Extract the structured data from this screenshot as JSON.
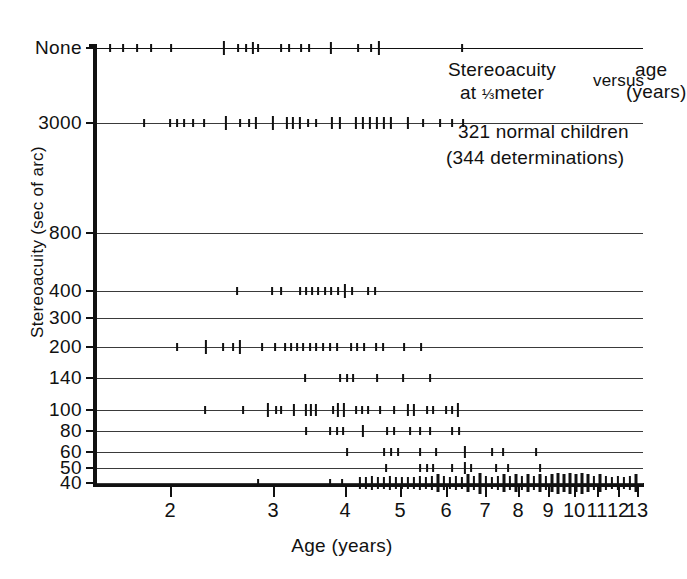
{
  "chart_data": {
    "type": "scatter",
    "subtitle": "321 normal children",
    "subtitle2": "(344 determinations)",
    "title_parts": {
      "stereoacuity": "Stereoacuity",
      "at_meter_pre": "at ",
      "fraction": "1/3",
      "at_meter_post": "meter",
      "versus": "versus",
      "age": "age",
      "years": "(years)"
    },
    "xlabel": "Age (years)",
    "ylabel": "Stereoacuity (sec of arc)",
    "xscale": "log",
    "xlim": [
      1.3,
      13.4
    ],
    "grid": true,
    "legend": "none",
    "n_children": 321,
    "n_determinations": 344,
    "xticks": [
      {
        "label": "2",
        "value": 2,
        "px": 170
      },
      {
        "label": "3",
        "value": 3,
        "px": 273
      },
      {
        "label": "4",
        "value": 4,
        "px": 345
      },
      {
        "label": "5",
        "value": 5,
        "px": 400
      },
      {
        "label": "6",
        "value": 6,
        "px": 446
      },
      {
        "label": "7",
        "value": 7,
        "px": 485
      },
      {
        "label": "8",
        "value": 8,
        "px": 518
      },
      {
        "label": "9",
        "value": 9,
        "px": 548
      },
      {
        "label": "10",
        "value": 10,
        "px": 574
      },
      {
        "label": "11",
        "value": 11,
        "px": 597
      },
      {
        "label": "12",
        "value": 12,
        "px": 618
      },
      {
        "label": "13",
        "value": 13,
        "px": 637
      }
    ],
    "yticks": [
      {
        "label": "None",
        "value": "None",
        "px": 48
      },
      {
        "label": "3000",
        "value": 3000,
        "px": 123
      },
      {
        "label": "800",
        "value": 800,
        "px": 233
      },
      {
        "label": "400",
        "value": 400,
        "px": 291
      },
      {
        "label": "300",
        "value": 300,
        "px": 318
      },
      {
        "label": "200",
        "value": 200,
        "px": 347
      },
      {
        "label": "140",
        "value": 140,
        "px": 378
      },
      {
        "label": "100",
        "value": 100,
        "px": 410
      },
      {
        "label": "80",
        "value": 80,
        "px": 431
      },
      {
        "label": "60",
        "value": 60,
        "px": 452
      },
      {
        "label": "50",
        "value": 50,
        "px": 468
      },
      {
        "label": "40",
        "value": 40,
        "px": 483
      }
    ],
    "series": [
      {
        "name": "None",
        "y_label": "None",
        "row_px": 48,
        "points": [
          {
            "x_px": 110,
            "count": 1
          },
          {
            "x_px": 123,
            "count": 1
          },
          {
            "x_px": 137,
            "count": 1
          },
          {
            "x_px": 151,
            "count": 1
          },
          {
            "x_px": 171,
            "count": 1
          },
          {
            "x_px": 224,
            "count": 3
          },
          {
            "x_px": 238,
            "count": 1
          },
          {
            "x_px": 246,
            "count": 1
          },
          {
            "x_px": 253,
            "count": 2
          },
          {
            "x_px": 258,
            "count": 1
          },
          {
            "x_px": 281,
            "count": 1
          },
          {
            "x_px": 289,
            "count": 1
          },
          {
            "x_px": 301,
            "count": 1
          },
          {
            "x_px": 309,
            "count": 1
          },
          {
            "x_px": 331,
            "count": 2
          },
          {
            "x_px": 358,
            "count": 1
          },
          {
            "x_px": 371,
            "count": 1
          },
          {
            "x_px": 379,
            "count": 3
          },
          {
            "x_px": 462,
            "count": 1
          }
        ]
      },
      {
        "name": "3000",
        "y_label": "3000",
        "row_px": 123,
        "points": [
          {
            "x_px": 144,
            "count": 1
          },
          {
            "x_px": 170,
            "count": 1
          },
          {
            "x_px": 177,
            "count": 1
          },
          {
            "x_px": 184,
            "count": 1
          },
          {
            "x_px": 193,
            "count": 1
          },
          {
            "x_px": 204,
            "count": 1
          },
          {
            "x_px": 226,
            "count": 3
          },
          {
            "x_px": 240,
            "count": 1
          },
          {
            "x_px": 249,
            "count": 1
          },
          {
            "x_px": 256,
            "count": 2
          },
          {
            "x_px": 273,
            "count": 3
          },
          {
            "x_px": 287,
            "count": 2
          },
          {
            "x_px": 293,
            "count": 2
          },
          {
            "x_px": 300,
            "count": 2
          },
          {
            "x_px": 308,
            "count": 1
          },
          {
            "x_px": 316,
            "count": 1
          },
          {
            "x_px": 332,
            "count": 2
          },
          {
            "x_px": 340,
            "count": 2
          },
          {
            "x_px": 356,
            "count": 2
          },
          {
            "x_px": 363,
            "count": 2
          },
          {
            "x_px": 370,
            "count": 2
          },
          {
            "x_px": 377,
            "count": 2
          },
          {
            "x_px": 384,
            "count": 2
          },
          {
            "x_px": 391,
            "count": 2
          },
          {
            "x_px": 408,
            "count": 2
          },
          {
            "x_px": 423,
            "count": 1
          },
          {
            "x_px": 440,
            "count": 1
          },
          {
            "x_px": 452,
            "count": 1
          },
          {
            "x_px": 463,
            "count": 1
          }
        ]
      },
      {
        "name": "800",
        "y_label": "800",
        "row_px": 233,
        "points": []
      },
      {
        "name": "400",
        "y_label": "400",
        "row_px": 291,
        "points": [
          {
            "x_px": 237,
            "count": 1
          },
          {
            "x_px": 272,
            "count": 1
          },
          {
            "x_px": 281,
            "count": 1
          },
          {
            "x_px": 300,
            "count": 1
          },
          {
            "x_px": 306,
            "count": 1
          },
          {
            "x_px": 312,
            "count": 1
          },
          {
            "x_px": 318,
            "count": 1
          },
          {
            "x_px": 325,
            "count": 1
          },
          {
            "x_px": 331,
            "count": 1
          },
          {
            "x_px": 338,
            "count": 1
          },
          {
            "x_px": 345,
            "count": 3
          },
          {
            "x_px": 352,
            "count": 1
          },
          {
            "x_px": 368,
            "count": 1
          },
          {
            "x_px": 375,
            "count": 1
          }
        ]
      },
      {
        "name": "300",
        "y_label": "300",
        "row_px": 318,
        "points": []
      },
      {
        "name": "200",
        "y_label": "200",
        "row_px": 347,
        "points": [
          {
            "x_px": 177,
            "count": 1
          },
          {
            "x_px": 206,
            "count": 3
          },
          {
            "x_px": 223,
            "count": 1
          },
          {
            "x_px": 233,
            "count": 1
          },
          {
            "x_px": 240,
            "count": 3
          },
          {
            "x_px": 262,
            "count": 1
          },
          {
            "x_px": 275,
            "count": 1
          },
          {
            "x_px": 285,
            "count": 1
          },
          {
            "x_px": 291,
            "count": 1
          },
          {
            "x_px": 297,
            "count": 1
          },
          {
            "x_px": 303,
            "count": 1
          },
          {
            "x_px": 310,
            "count": 1
          },
          {
            "x_px": 316,
            "count": 1
          },
          {
            "x_px": 323,
            "count": 1
          },
          {
            "x_px": 330,
            "count": 1
          },
          {
            "x_px": 337,
            "count": 1
          },
          {
            "x_px": 351,
            "count": 1
          },
          {
            "x_px": 357,
            "count": 1
          },
          {
            "x_px": 364,
            "count": 1
          },
          {
            "x_px": 376,
            "count": 1
          },
          {
            "x_px": 383,
            "count": 1
          },
          {
            "x_px": 404,
            "count": 1
          },
          {
            "x_px": 421,
            "count": 1
          }
        ]
      },
      {
        "name": "140",
        "y_label": "140",
        "row_px": 378,
        "points": [
          {
            "x_px": 305,
            "count": 1
          },
          {
            "x_px": 340,
            "count": 1
          },
          {
            "x_px": 347,
            "count": 1
          },
          {
            "x_px": 353,
            "count": 1
          },
          {
            "x_px": 377,
            "count": 1
          },
          {
            "x_px": 403,
            "count": 1
          },
          {
            "x_px": 430,
            "count": 1
          }
        ]
      },
      {
        "name": "100",
        "y_label": "100",
        "row_px": 410,
        "points": [
          {
            "x_px": 205,
            "count": 1
          },
          {
            "x_px": 243,
            "count": 1
          },
          {
            "x_px": 268,
            "count": 3
          },
          {
            "x_px": 276,
            "count": 1
          },
          {
            "x_px": 281,
            "count": 1
          },
          {
            "x_px": 294,
            "count": 2
          },
          {
            "x_px": 306,
            "count": 2
          },
          {
            "x_px": 311,
            "count": 2
          },
          {
            "x_px": 316,
            "count": 2
          },
          {
            "x_px": 333,
            "count": 1
          },
          {
            "x_px": 338,
            "count": 3
          },
          {
            "x_px": 344,
            "count": 3
          },
          {
            "x_px": 356,
            "count": 1
          },
          {
            "x_px": 362,
            "count": 1
          },
          {
            "x_px": 368,
            "count": 1
          },
          {
            "x_px": 380,
            "count": 1
          },
          {
            "x_px": 394,
            "count": 1
          },
          {
            "x_px": 408,
            "count": 2
          },
          {
            "x_px": 414,
            "count": 2
          },
          {
            "x_px": 427,
            "count": 1
          },
          {
            "x_px": 433,
            "count": 1
          },
          {
            "x_px": 446,
            "count": 1
          },
          {
            "x_px": 452,
            "count": 1
          },
          {
            "x_px": 458,
            "count": 3
          }
        ]
      },
      {
        "name": "80",
        "y_label": "80",
        "row_px": 431,
        "points": [
          {
            "x_px": 306,
            "count": 1
          },
          {
            "x_px": 330,
            "count": 1
          },
          {
            "x_px": 337,
            "count": 1
          },
          {
            "x_px": 343,
            "count": 1
          },
          {
            "x_px": 363,
            "count": 2
          },
          {
            "x_px": 387,
            "count": 1
          },
          {
            "x_px": 394,
            "count": 1
          },
          {
            "x_px": 410,
            "count": 1
          },
          {
            "x_px": 420,
            "count": 1
          },
          {
            "x_px": 430,
            "count": 1
          },
          {
            "x_px": 452,
            "count": 1
          },
          {
            "x_px": 459,
            "count": 1
          }
        ]
      },
      {
        "name": "60",
        "y_label": "60",
        "row_px": 452,
        "points": [
          {
            "x_px": 347,
            "count": 1
          },
          {
            "x_px": 384,
            "count": 1
          },
          {
            "x_px": 391,
            "count": 1
          },
          {
            "x_px": 398,
            "count": 1
          },
          {
            "x_px": 420,
            "count": 1
          },
          {
            "x_px": 436,
            "count": 1
          },
          {
            "x_px": 465,
            "count": 2
          },
          {
            "x_px": 492,
            "count": 1
          },
          {
            "x_px": 503,
            "count": 1
          },
          {
            "x_px": 536,
            "count": 1
          }
        ]
      },
      {
        "name": "50",
        "y_label": "50",
        "row_px": 468,
        "points": [
          {
            "x_px": 386,
            "count": 1
          },
          {
            "x_px": 420,
            "count": 1
          },
          {
            "x_px": 427,
            "count": 1
          },
          {
            "x_px": 433,
            "count": 1
          },
          {
            "x_px": 452,
            "count": 1
          },
          {
            "x_px": 465,
            "count": 2
          },
          {
            "x_px": 471,
            "count": 1
          },
          {
            "x_px": 496,
            "count": 1
          },
          {
            "x_px": 508,
            "count": 1
          },
          {
            "x_px": 540,
            "count": 1
          }
        ]
      },
      {
        "name": "40",
        "y_label": "40",
        "row_px": 483,
        "points": [
          {
            "x_px": 258,
            "count": 1
          },
          {
            "x_px": 330,
            "count": 1
          },
          {
            "x_px": 342,
            "count": 1
          },
          {
            "x_px": 360,
            "count": 2
          },
          {
            "x_px": 366,
            "count": 2
          },
          {
            "x_px": 372,
            "count": 3
          },
          {
            "x_px": 378,
            "count": 2
          },
          {
            "x_px": 384,
            "count": 2
          },
          {
            "x_px": 390,
            "count": 3
          },
          {
            "x_px": 396,
            "count": 2
          },
          {
            "x_px": 402,
            "count": 2
          },
          {
            "x_px": 408,
            "count": 2
          },
          {
            "x_px": 414,
            "count": 2
          },
          {
            "x_px": 420,
            "count": 3
          },
          {
            "x_px": 426,
            "count": 2
          },
          {
            "x_px": 432,
            "count": 3
          },
          {
            "x_px": 438,
            "count": 4
          },
          {
            "x_px": 444,
            "count": 3
          },
          {
            "x_px": 450,
            "count": 2
          },
          {
            "x_px": 456,
            "count": 3
          },
          {
            "x_px": 462,
            "count": 2
          },
          {
            "x_px": 468,
            "count": 4
          },
          {
            "x_px": 474,
            "count": 3
          },
          {
            "x_px": 480,
            "count": 5
          },
          {
            "x_px": 486,
            "count": 3
          },
          {
            "x_px": 492,
            "count": 2
          },
          {
            "x_px": 498,
            "count": 3
          },
          {
            "x_px": 504,
            "count": 4
          },
          {
            "x_px": 510,
            "count": 3
          },
          {
            "x_px": 516,
            "count": 4
          },
          {
            "x_px": 522,
            "count": 3
          },
          {
            "x_px": 528,
            "count": 4
          },
          {
            "x_px": 534,
            "count": 3
          },
          {
            "x_px": 540,
            "count": 4
          },
          {
            "x_px": 546,
            "count": 3
          },
          {
            "x_px": 552,
            "count": 4
          },
          {
            "x_px": 558,
            "count": 5
          },
          {
            "x_px": 564,
            "count": 4
          },
          {
            "x_px": 570,
            "count": 5
          },
          {
            "x_px": 576,
            "count": 4
          },
          {
            "x_px": 582,
            "count": 5
          },
          {
            "x_px": 588,
            "count": 4
          },
          {
            "x_px": 594,
            "count": 3
          },
          {
            "x_px": 600,
            "count": 4
          },
          {
            "x_px": 606,
            "count": 3
          },
          {
            "x_px": 612,
            "count": 2
          },
          {
            "x_px": 618,
            "count": 3
          },
          {
            "x_px": 624,
            "count": 2
          },
          {
            "x_px": 630,
            "count": 3
          },
          {
            "x_px": 636,
            "count": 4
          }
        ]
      }
    ]
  }
}
